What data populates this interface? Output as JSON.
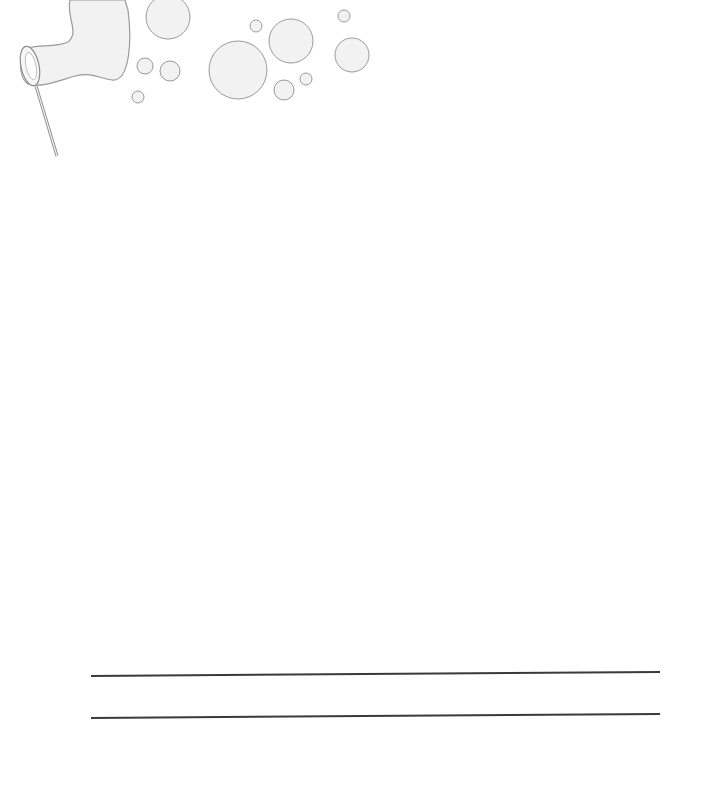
{
  "page": {
    "type": "stationery",
    "background": "#ffffff"
  },
  "illustration": {
    "icon": "bubble-wand-icon",
    "stroke_color": "#9a9a9a",
    "fill_color": "#f2f2f2",
    "bubbles": [
      {
        "cx": 168,
        "cy": 17,
        "r": 22
      },
      {
        "cx": 145,
        "cy": 66,
        "r": 8
      },
      {
        "cx": 170,
        "cy": 71,
        "r": 10
      },
      {
        "cx": 138,
        "cy": 97,
        "r": 6
      },
      {
        "cx": 238,
        "cy": 70,
        "r": 29
      },
      {
        "cx": 256,
        "cy": 26,
        "r": 6
      },
      {
        "cx": 291,
        "cy": 41,
        "r": 22
      },
      {
        "cx": 284,
        "cy": 90,
        "r": 10
      },
      {
        "cx": 306,
        "cy": 79,
        "r": 6
      },
      {
        "cx": 344,
        "cy": 16,
        "r": 6
      },
      {
        "cx": 352,
        "cy": 55,
        "r": 17
      }
    ]
  },
  "writing_lines": [
    {
      "x1": 91,
      "y1": 675,
      "x2": 660,
      "y2": 671
    },
    {
      "x1": 91,
      "y1": 717,
      "x2": 660,
      "y2": 713
    }
  ]
}
